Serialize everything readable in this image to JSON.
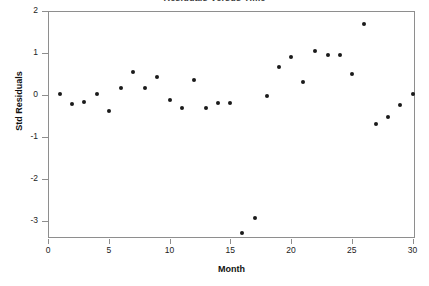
{
  "chart_data": {
    "type": "scatter",
    "title": "Residuals Versus Time",
    "xlabel": "Month",
    "ylabel": "Std Residuals",
    "xlim": [
      0,
      30.2
    ],
    "ylim": [
      -3.4,
      2.0
    ],
    "grid": false,
    "legend": null,
    "marker": "filled-circle",
    "marker_color": "#1a1a1a",
    "x_ticks": [
      0,
      5,
      10,
      15,
      20,
      25,
      30
    ],
    "y_ticks": [
      2,
      1,
      0,
      -1,
      -2,
      -3
    ],
    "x_tick_labels": [
      "0",
      "5",
      "10",
      "15",
      "20",
      "25",
      "30"
    ],
    "y_tick_labels": [
      "2",
      "1",
      "0",
      "-1",
      "-2",
      "-3"
    ],
    "x": [
      1,
      2,
      3,
      4,
      5,
      6,
      7,
      8,
      9,
      10,
      11,
      12,
      13,
      14,
      15,
      16,
      17,
      18,
      19,
      20,
      21,
      22,
      23,
      24,
      25,
      26,
      27,
      28,
      29,
      30
    ],
    "y": [
      0.03,
      -0.21,
      -0.17,
      0.02,
      -0.37,
      0.17,
      0.54,
      0.17,
      0.42,
      -0.12,
      -0.3,
      0.35,
      -0.31,
      -0.19,
      -0.18,
      -3.29,
      -2.93,
      -0.02,
      0.67,
      0.9,
      0.32,
      1.05,
      0.96,
      0.96,
      0.51,
      1.68,
      -0.68,
      -0.52,
      -0.24,
      0.02
    ],
    "points": [
      {
        "month": 1,
        "residual": 0.03
      },
      {
        "month": 2,
        "residual": -0.21
      },
      {
        "month": 3,
        "residual": -0.17
      },
      {
        "month": 4,
        "residual": 0.02
      },
      {
        "month": 5,
        "residual": -0.37
      },
      {
        "month": 6,
        "residual": 0.17
      },
      {
        "month": 7,
        "residual": 0.54
      },
      {
        "month": 8,
        "residual": 0.17
      },
      {
        "month": 9,
        "residual": 0.42
      },
      {
        "month": 10,
        "residual": -0.12
      },
      {
        "month": 11,
        "residual": -0.3
      },
      {
        "month": 12,
        "residual": 0.35
      },
      {
        "month": 13,
        "residual": -0.31
      },
      {
        "month": 14,
        "residual": -0.19
      },
      {
        "month": 15,
        "residual": -0.18
      },
      {
        "month": 16,
        "residual": -3.29
      },
      {
        "month": 17,
        "residual": -2.93
      },
      {
        "month": 18,
        "residual": -0.02
      },
      {
        "month": 19,
        "residual": 0.67
      },
      {
        "month": 20,
        "residual": 0.9
      },
      {
        "month": 21,
        "residual": 0.32
      },
      {
        "month": 22,
        "residual": 1.05
      },
      {
        "month": 23,
        "residual": 0.96
      },
      {
        "month": 24,
        "residual": 0.96
      },
      {
        "month": 25,
        "residual": 0.51
      },
      {
        "month": 26,
        "residual": 1.68
      },
      {
        "month": 27,
        "residual": -0.68
      },
      {
        "month": 28,
        "residual": -0.52
      },
      {
        "month": 29,
        "residual": -0.24
      },
      {
        "month": 30,
        "residual": 0.02
      }
    ]
  },
  "colors": {
    "marker": "#1a1a1a",
    "frame": "#8e8e8e",
    "text": "#111111",
    "background": "#ffffff"
  }
}
